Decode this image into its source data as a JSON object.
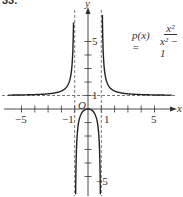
{
  "header": {
    "problem_number": "33."
  },
  "chart_data": {
    "type": "line",
    "title": "",
    "function_label": "p(x) =",
    "function_numerator": "x²",
    "function_denominator": "x² − 1",
    "xlabel": "x",
    "ylabel": "y",
    "origin_label": "O",
    "xlim": [
      -6.5,
      6.5
    ],
    "ylim": [
      -6,
      5.5
    ],
    "x_tick_labels": [
      {
        "x": -5,
        "label": "−5"
      },
      {
        "x": -1,
        "label": "−1"
      },
      {
        "x": 1,
        "label": "1"
      },
      {
        "x": 5,
        "label": "5"
      }
    ],
    "y_tick_labels": [
      {
        "y": 5,
        "label": "5"
      },
      {
        "y": 1,
        "label": "1"
      },
      {
        "y": -5,
        "label": "−5"
      }
    ],
    "x_ticks": [
      -5,
      -4,
      -3,
      -2,
      -1,
      1,
      2,
      3,
      4,
      5
    ],
    "y_ticks": [
      -5,
      -4,
      -3,
      -2,
      -1,
      1,
      2,
      3,
      4,
      5
    ],
    "asymptotes": {
      "vertical": [
        -1,
        1
      ],
      "horizontal": [
        1
      ]
    },
    "grid": false,
    "series": [
      {
        "name": "left branch (x < -1)",
        "x": [
          -6,
          -5,
          -4,
          -3,
          -2,
          -1.5,
          -1.25,
          -1.1
        ],
        "y": [
          1.03,
          1.04,
          1.07,
          1.13,
          1.33,
          1.8,
          2.78,
          5.76
        ]
      },
      {
        "name": "middle branch (-1 < x < 1)",
        "x": [
          -0.9,
          -0.8,
          -0.6,
          -0.4,
          -0.2,
          0,
          0.2,
          0.4,
          0.6,
          0.8,
          0.9
        ],
        "y": [
          -4.26,
          -1.78,
          -0.56,
          -0.19,
          -0.04,
          0,
          -0.04,
          -0.19,
          -0.56,
          -1.78,
          -4.26
        ]
      },
      {
        "name": "right branch (x > 1)",
        "x": [
          1.1,
          1.25,
          1.5,
          2,
          3,
          4,
          5,
          6
        ],
        "y": [
          5.76,
          2.78,
          1.8,
          1.33,
          1.13,
          1.07,
          1.04,
          1.03
        ]
      }
    ]
  }
}
